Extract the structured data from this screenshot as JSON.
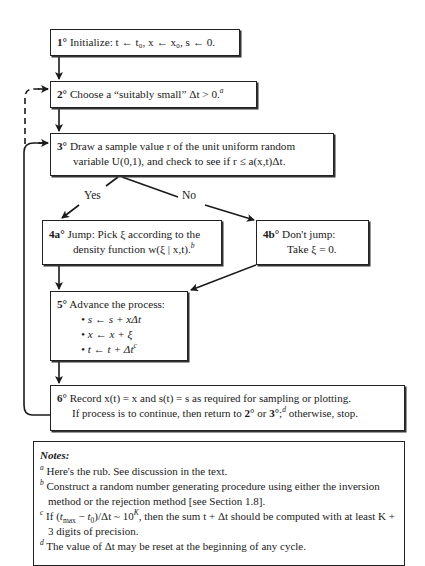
{
  "flowchart": {
    "step1": {
      "num": "1°",
      "text": "Initialize: t ← t₀, x ← x₀, s ← 0."
    },
    "step2": {
      "num": "2°",
      "text": "Choose a “suitably small” Δt > 0.",
      "footnote": "a"
    },
    "step3": {
      "num": "3°",
      "line1": "Draw a sample value r of the unit uniform random",
      "line2": "variable U(0,1), and check to see if r ≤ a(x,t)Δt."
    },
    "branch_yes": "Yes",
    "branch_no": "No",
    "step4a": {
      "num": "4a°",
      "line1": "Jump: Pick ξ according to the",
      "line2": "density function w(ξ | x,t).",
      "footnote": "b"
    },
    "step4b": {
      "num": "4b°",
      "line1": "Don't jump:",
      "line2": "Take ξ = 0."
    },
    "step5": {
      "num": "5°",
      "title": "Advance the process:",
      "bullets": [
        "s ← s + xΔt",
        "x ← x + ξ",
        "t ← t + Δt"
      ],
      "bullet3_footnote": "c"
    },
    "step6": {
      "num": "6°",
      "line1": "Record x(t) = x and s(t) = s as required for sampling or plotting.",
      "line2a": "If process is to continue, then return to ",
      "ref2": "2°",
      "or": " or ",
      "ref3": "3°",
      "semicolon": ";",
      "footnote": "d",
      "line2b": " otherwise, stop."
    }
  },
  "notes": {
    "title": "Notes:",
    "items": [
      {
        "mark": "a",
        "text": "Here's the rub.  See discussion in the text."
      },
      {
        "mark": "b",
        "text": "Construct a random number generating procedure using either the inversion method or the rejection method [see Section 1.8]."
      },
      {
        "mark": "c",
        "text": "If (tmax − t0)/Δt ~ 10^K, then the sum t + Δt should be computed with at least K + 3 digits of precision."
      },
      {
        "mark": "d",
        "text": "The value of Δt may be reset at the beginning of any cycle."
      }
    ],
    "c_parts": {
      "pre": "If (",
      "tmax": "t",
      "tmax_sub": "max",
      "minus": " − ",
      "t0": "t",
      "t0_sub": "0",
      "mid": ")/Δt ~ 10",
      "exp": "K",
      "post": ",  then the sum  t + Δt  should be computed with at least K + 3 digits of precision."
    }
  },
  "colors": {
    "line": "#1a1a1a",
    "background": "#ffffff"
  }
}
